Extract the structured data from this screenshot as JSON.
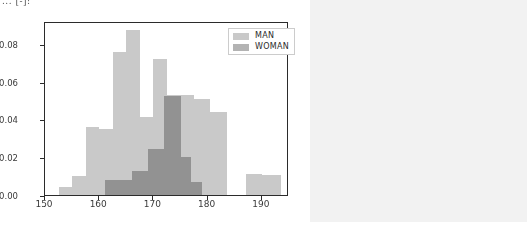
{
  "page": {
    "clipped_header_text": "... [-]:",
    "background_color": "#f2f2f2",
    "figure_background": "#ffffff"
  },
  "legend": {
    "position": "upper right",
    "entries": [
      {
        "label": "MAN",
        "color": "#c9c9c9"
      },
      {
        "label": "WOMAN",
        "color": "#b3b3b3"
      }
    ]
  },
  "chart_data": {
    "type": "bar",
    "chart_kind": "histogram",
    "title": "",
    "xlabel": "",
    "ylabel": "",
    "xlim": [
      150,
      195
    ],
    "ylim": [
      0.0,
      0.092
    ],
    "grid": false,
    "legend_position": "upper right",
    "xticks": [
      "150",
      "160",
      "170",
      "180",
      "190"
    ],
    "xtick_values": [
      150,
      160,
      170,
      180,
      190
    ],
    "yticks": [
      "0.00",
      "0.02",
      "0.04",
      "0.06",
      "0.08"
    ],
    "ytick_values": [
      0.0,
      0.02,
      0.04,
      0.06,
      0.08
    ],
    "colors": {
      "man": "#c9c9c9",
      "woman": "#b3b3b3",
      "overlap": "#a9a9a9"
    },
    "series": [
      {
        "name": "MAN",
        "color": "#c9c9c9",
        "bins": [
          {
            "start": 152.5,
            "end": 155.0,
            "value": 0.004
          },
          {
            "start": 155.0,
            "end": 157.5,
            "value": 0.01
          },
          {
            "start": 157.5,
            "end": 160.0,
            "value": 0.036
          },
          {
            "start": 160.0,
            "end": 162.5,
            "value": 0.035
          },
          {
            "start": 162.5,
            "end": 165.0,
            "value": 0.0755
          },
          {
            "start": 165.0,
            "end": 167.5,
            "value": 0.087
          },
          {
            "start": 167.5,
            "end": 170.0,
            "value": 0.041
          },
          {
            "start": 170.0,
            "end": 172.5,
            "value": 0.072
          },
          {
            "start": 172.5,
            "end": 175.0,
            "value": 0.053
          },
          {
            "start": 175.0,
            "end": 177.5,
            "value": 0.053
          },
          {
            "start": 177.5,
            "end": 180.5,
            "value": 0.051
          },
          {
            "start": 180.5,
            "end": 183.5,
            "value": 0.044
          },
          {
            "start": 187.0,
            "end": 190.0,
            "value": 0.011
          },
          {
            "start": 190.0,
            "end": 193.5,
            "value": 0.0105
          }
        ]
      },
      {
        "name": "WOMAN",
        "color": "#b3b3b3",
        "bins": [
          {
            "start": 161.0,
            "end": 166.0,
            "value": 0.008
          },
          {
            "start": 166.0,
            "end": 169.0,
            "value": 0.0125
          },
          {
            "start": 169.0,
            "end": 172.0,
            "value": 0.0245
          },
          {
            "start": 172.0,
            "end": 175.0,
            "value": 0.0525
          },
          {
            "start": 175.0,
            "end": 177.0,
            "value": 0.02
          },
          {
            "start": 177.0,
            "end": 179.0,
            "value": 0.007
          }
        ]
      }
    ]
  }
}
